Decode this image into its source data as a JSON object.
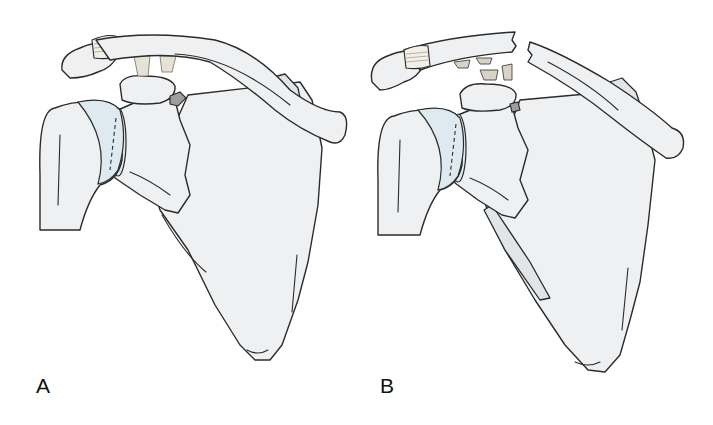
{
  "figure": {
    "type": "anatomical-illustration",
    "background": "#ffffff",
    "bone_fill": "#eef0f1",
    "outline_color": "#2b2b2b",
    "panels": [
      {
        "label": "A",
        "state": "intact clavicle with intact coracoclavicular ligaments"
      },
      {
        "label": "B",
        "state": "fractured clavicle with torn coracoclavicular ligaments"
      }
    ]
  }
}
